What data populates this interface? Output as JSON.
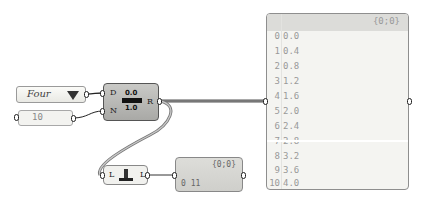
{
  "value_list": {
    "selected": "Four"
  },
  "number_panel": {
    "value": "10"
  },
  "series_component": {
    "inputs": [
      "D",
      "N"
    ],
    "output": "R",
    "icon": "series-icon",
    "icon_text_top": "0.0",
    "icon_text_bottom": "1.0"
  },
  "list_length_component": {
    "input": "L",
    "output": "L",
    "icon": "list-length-icon"
  },
  "length_panel": {
    "path": "{0;0}",
    "rows": [
      {
        "index": "0",
        "value": "11"
      }
    ]
  },
  "output_panel": {
    "path": "{0;0}",
    "rows": [
      {
        "index": "0",
        "value": "0.0"
      },
      {
        "index": "1",
        "value": "0.4"
      },
      {
        "index": "2",
        "value": "0.8"
      },
      {
        "index": "3",
        "value": "1.2"
      },
      {
        "index": "4",
        "value": "1.6"
      },
      {
        "index": "5",
        "value": "2.0"
      },
      {
        "index": "6",
        "value": "2.4"
      },
      {
        "index": "7",
        "value": "2.8"
      },
      {
        "index": "8",
        "value": "3.2"
      },
      {
        "index": "9",
        "value": "3.6"
      },
      {
        "index": "10",
        "value": "4.0"
      }
    ]
  }
}
